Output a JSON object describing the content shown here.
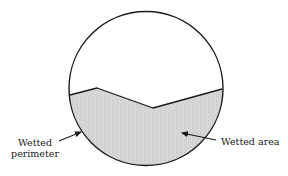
{
  "diagram": {
    "labels": {
      "wetted_perimeter_line1": "Wetted",
      "wetted_perimeter_line2": "perimeter",
      "wetted_area": "Wetted area"
    },
    "colors": {
      "outline": "#1a1a1a",
      "water_fill": "#d6d6d6",
      "background": "#ffffff"
    },
    "shapes": {
      "circle": {
        "cx": 146,
        "cy": 88.5,
        "r": 77
      },
      "water_surface_points": [
        [
          70,
          95
        ],
        [
          97,
          88
        ],
        [
          153,
          108
        ],
        [
          222,
          89
        ]
      ]
    },
    "arrows": [
      {
        "name": "wetted-perimeter-arrow",
        "from": [
          59,
          141
        ],
        "to": [
          81,
          132
        ]
      },
      {
        "name": "wetted-area-arrow",
        "from": [
          216,
          140
        ],
        "to": [
          182,
          133
        ]
      }
    ]
  }
}
